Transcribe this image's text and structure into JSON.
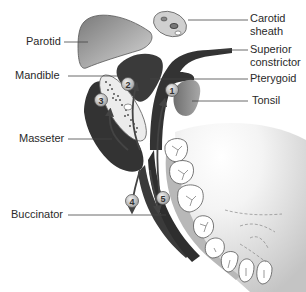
{
  "diagram": {
    "type": "anatomical-cross-section",
    "labels_left": [
      {
        "id": "parotid",
        "text": "Parotid"
      },
      {
        "id": "mandible",
        "text": "Mandible"
      },
      {
        "id": "masseter",
        "text": "Masseter"
      },
      {
        "id": "buccinator",
        "text": "Buccinator"
      }
    ],
    "labels_right": [
      {
        "id": "carotid-sheath",
        "line1": "Carotid",
        "line2": "sheath"
      },
      {
        "id": "superior-constrictor",
        "line1": "Superior",
        "line2": "constrictor"
      },
      {
        "id": "pterygoid",
        "text": "Pterygoid"
      },
      {
        "id": "tonsil",
        "text": "Tonsil"
      }
    ],
    "numbered_markers": [
      "1",
      "2",
      "3",
      "4",
      "5"
    ],
    "colors": {
      "muscle_dark": "#3a3a3a",
      "parotid_gray": "#9a9a9a",
      "tonsil_gray": "#8c8c8c",
      "marker_fill": "#c8c8c8",
      "bone_light": "#e6e6e6",
      "tooth_fill": "#ffffff",
      "gum_gray": "#bdbdbd"
    }
  }
}
